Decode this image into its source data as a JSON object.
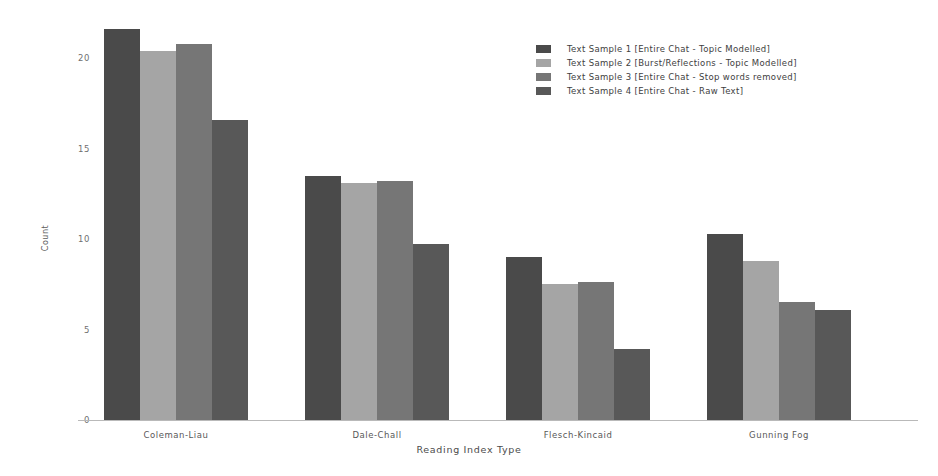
{
  "chart_data": {
    "type": "bar",
    "title": "",
    "xlabel": "Reading Index Type",
    "ylabel": "Count",
    "categories": [
      "Coleman-Liau",
      "Dale-Chall",
      "Flesch-Kincaid",
      "Gunning Fog"
    ],
    "yticks": [
      "0",
      "5",
      "10",
      "15",
      "20"
    ],
    "ytick_values": [
      0,
      5,
      10,
      15,
      20
    ],
    "ylim": [
      0,
      22.5
    ],
    "grid": false,
    "legend_position": "upper right",
    "series": [
      {
        "name": "Text Sample 1 [Entire Chat - Topic Modelled]",
        "color": "#4a4a4a",
        "values": [
          21.6,
          13.5,
          9.0,
          10.3
        ]
      },
      {
        "name": "Text Sample 2 [Burst/Reflections - Topic Modelled]",
        "color": "#a5a5a5",
        "values": [
          20.4,
          13.1,
          7.5,
          8.8
        ]
      },
      {
        "name": "Text Sample 3 [Entire Chat - Stop words removed]",
        "color": "#767676",
        "values": [
          20.8,
          13.2,
          7.6,
          6.5
        ]
      },
      {
        "name": "Text Sample 4 [Entire Chat - Raw Text]",
        "color": "#585858",
        "values": [
          16.6,
          9.7,
          3.9,
          6.1
        ]
      }
    ]
  },
  "axis": {
    "baseline_color": "#b9b9b9",
    "tick_color": "#6f6f6f"
  }
}
